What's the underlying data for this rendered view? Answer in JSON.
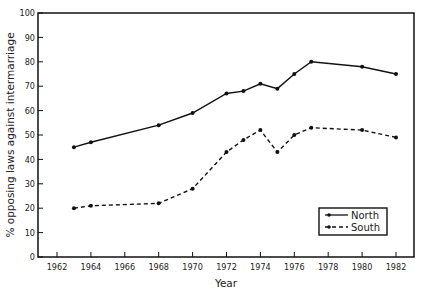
{
  "chart_data": {
    "type": "line",
    "title": "",
    "xlabel": "Year",
    "ylabel": "% opposing laws against intermarriage",
    "xlim": [
      1961,
      1983
    ],
    "ylim": [
      0,
      100
    ],
    "x_ticks": [
      1962,
      1964,
      1966,
      1968,
      1970,
      1972,
      1974,
      1976,
      1978,
      1980,
      1982
    ],
    "y_ticks": [
      0,
      10,
      20,
      30,
      40,
      50,
      60,
      70,
      80,
      90,
      100
    ],
    "grid": false,
    "legend_position": "lower right",
    "series": [
      {
        "name": "North",
        "style": "solid",
        "x": [
          1963,
          1964,
          1968,
          1970,
          1972,
          1973,
          1974,
          1975,
          1976,
          1977,
          1980,
          1982
        ],
        "values": [
          45,
          47,
          54,
          59,
          67,
          68,
          71,
          69,
          75,
          80,
          78,
          75
        ]
      },
      {
        "name": "South",
        "style": "dashed",
        "x": [
          1963,
          1964,
          1968,
          1970,
          1972,
          1973,
          1974,
          1975,
          1976,
          1977,
          1980,
          1982
        ],
        "values": [
          20,
          21,
          22,
          28,
          43,
          48,
          52,
          43,
          50,
          53,
          52,
          49
        ]
      }
    ]
  },
  "labels": {
    "xlabel": "Year",
    "ylabel": "% opposing laws against intermarriage",
    "legend_north": "North",
    "legend_south": "South"
  }
}
